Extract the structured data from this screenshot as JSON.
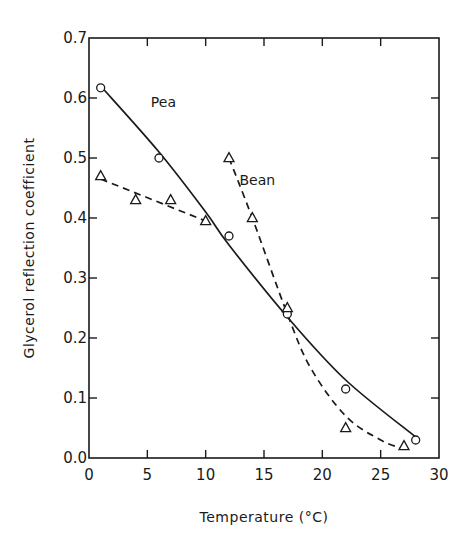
{
  "chart_data": {
    "type": "scatter",
    "title": "",
    "xlabel": "Temperature (°C)",
    "ylabel": "Glycerol reflection coefficient",
    "xlim": [
      0,
      30
    ],
    "ylim": [
      0.0,
      0.7
    ],
    "xticks": [
      0,
      5,
      10,
      15,
      20,
      25,
      30
    ],
    "xtick_labels": [
      "0",
      "5",
      "10",
      "15",
      "20",
      "25",
      "30"
    ],
    "yticks": [
      0.0,
      0.1,
      0.2,
      0.3,
      0.4,
      0.5,
      0.6,
      0.7
    ],
    "ytick_labels": [
      "0.0",
      "0.1",
      "0.2",
      "0.3",
      "0.4",
      "0.5",
      "0.6",
      "0.7"
    ],
    "grid": false,
    "legend": "none",
    "annotations": [
      {
        "text": "Pea",
        "x": 5.3,
        "y": 0.585
      },
      {
        "text": "Bean",
        "x": 12.9,
        "y": 0.455
      }
    ],
    "series": [
      {
        "name": "Pea",
        "marker": "circle",
        "line": "solid",
        "points": [
          {
            "x": 1,
            "y": 0.617
          },
          {
            "x": 6,
            "y": 0.5
          },
          {
            "x": 12,
            "y": 0.37
          },
          {
            "x": 17,
            "y": 0.24
          },
          {
            "x": 22,
            "y": 0.115
          },
          {
            "x": 28,
            "y": 0.03
          }
        ],
        "fit": [
          {
            "x": 1,
            "y": 0.62
          },
          {
            "x": 6,
            "y": 0.51
          },
          {
            "x": 10,
            "y": 0.41
          },
          {
            "x": 12,
            "y": 0.355
          },
          {
            "x": 17,
            "y": 0.235
          },
          {
            "x": 22,
            "y": 0.13
          },
          {
            "x": 28,
            "y": 0.035
          }
        ]
      },
      {
        "name": "Bean",
        "marker": "triangle",
        "line": "dashed",
        "points": [
          {
            "x": 1,
            "y": 0.47
          },
          {
            "x": 4,
            "y": 0.43
          },
          {
            "x": 7,
            "y": 0.43
          },
          {
            "x": 10,
            "y": 0.395
          },
          {
            "x": 12,
            "y": 0.5
          },
          {
            "x": 14,
            "y": 0.4
          },
          {
            "x": 17,
            "y": 0.25
          },
          {
            "x": 22,
            "y": 0.05
          },
          {
            "x": 27,
            "y": 0.02
          }
        ],
        "fit_segments": [
          [
            {
              "x": 1,
              "y": 0.465
            },
            {
              "x": 10,
              "y": 0.395
            }
          ],
          [
            {
              "x": 12,
              "y": 0.5
            },
            {
              "x": 14,
              "y": 0.4
            },
            {
              "x": 17,
              "y": 0.24
            },
            {
              "x": 19,
              "y": 0.15
            },
            {
              "x": 22,
              "y": 0.07
            },
            {
              "x": 25,
              "y": 0.03
            },
            {
              "x": 27,
              "y": 0.015
            }
          ]
        ]
      }
    ]
  }
}
